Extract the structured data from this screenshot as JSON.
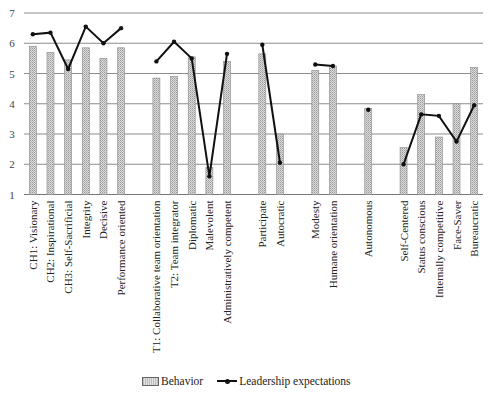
{
  "chart_data": {
    "type": "bar+line",
    "title": "",
    "xlabel": "",
    "ylabel": "",
    "ylim": [
      1,
      7
    ],
    "yticks": [
      1,
      2,
      3,
      4,
      5,
      6,
      7
    ],
    "grid": true,
    "legend_position": "bottom",
    "slots": 26,
    "categories": [
      {
        "slot": 0,
        "label": "CH1: Visionary"
      },
      {
        "slot": 1,
        "label": "CH2: Inspirational"
      },
      {
        "slot": 2,
        "label": "CH3: Self-Sacrificial"
      },
      {
        "slot": 3,
        "label": "Integrity"
      },
      {
        "slot": 4,
        "label": "Decisive"
      },
      {
        "slot": 5,
        "label": "Performance oriented"
      },
      {
        "slot": 7,
        "label": "T1: Collaborative team orientation"
      },
      {
        "slot": 8,
        "label": "T2: Team integrator"
      },
      {
        "slot": 9,
        "label": "Diplomatic"
      },
      {
        "slot": 10,
        "label": "Malevolent"
      },
      {
        "slot": 11,
        "label": "Administratively competent"
      },
      {
        "slot": 13,
        "label": "Participate"
      },
      {
        "slot": 14,
        "label": "Autocratic"
      },
      {
        "slot": 16,
        "label": "Modesty"
      },
      {
        "slot": 17,
        "label": "Humane orientation"
      },
      {
        "slot": 19,
        "label": "Autonomous"
      },
      {
        "slot": 21,
        "label": "Self-Centered"
      },
      {
        "slot": 22,
        "label": "Status conscious"
      },
      {
        "slot": 23,
        "label": "Internally competitive"
      },
      {
        "slot": 24,
        "label": "Face-Saver"
      },
      {
        "slot": 25,
        "label": "Bureaucratic"
      }
    ],
    "series": [
      {
        "name": "Behavior",
        "type": "bar",
        "values": [
          5.9,
          5.7,
          5.45,
          5.85,
          5.5,
          5.85,
          4.85,
          4.9,
          5.55,
          1.9,
          5.4,
          5.65,
          3.0,
          5.1,
          5.25,
          3.85,
          2.55,
          4.3,
          2.9,
          4.0,
          5.2
        ]
      },
      {
        "name": "Leadership expectations",
        "type": "line",
        "segments": [
          [
            0,
            5
          ],
          [
            6,
            10
          ],
          [
            11,
            12
          ],
          [
            13,
            14
          ],
          [
            15,
            15
          ],
          [
            16,
            20
          ]
        ],
        "values": [
          6.3,
          6.35,
          5.15,
          6.55,
          6.0,
          6.5,
          5.4,
          6.05,
          5.5,
          1.6,
          5.65,
          5.95,
          2.05,
          5.3,
          5.25,
          3.8,
          2.0,
          3.65,
          3.6,
          2.75,
          3.95
        ]
      }
    ]
  },
  "legend": {
    "behavior_label": "Behavior",
    "expectations_label": "Leadership expectations"
  }
}
